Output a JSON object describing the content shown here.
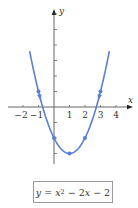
{
  "chart_data": {
    "type": "line",
    "title": "",
    "equation": "y = x^2 - 2x - 2",
    "xlabel": "x",
    "ylabel": "y",
    "xlim": [
      -2.8,
      5
    ],
    "ylim": [
      -4.5,
      6.8
    ],
    "x_ticks": [
      -2,
      -1,
      1,
      2,
      3,
      4
    ],
    "x_tick_labels": [
      "−2",
      "−1",
      "1",
      "2",
      "3",
      "4"
    ],
    "y_ticks": [
      -3,
      -2,
      -1,
      1,
      2,
      3,
      4,
      5,
      6
    ],
    "y_tick_labels": [],
    "grid": false,
    "series": [
      {
        "name": "y = x^2 - 2x - 2",
        "color": "#5b7fd6",
        "x": [
          -1,
          0,
          1,
          2,
          3
        ],
        "values": [
          1,
          -2,
          -3,
          -2,
          1
        ]
      }
    ],
    "marked_points": [
      [
        -1,
        1
      ],
      [
        0,
        -2
      ],
      [
        1,
        -3
      ],
      [
        2,
        -2
      ],
      [
        3,
        1
      ]
    ],
    "arrows": "curve has arrowheads on both branches near points (-1,1) and (3,1)"
  },
  "labels": {
    "x_axis": "x",
    "y_axis": "y",
    "equation_prefix": "y",
    "equation_eq": " = ",
    "equation_x": "x",
    "equation_exp": "2",
    "equation_rest_1": " − 2",
    "equation_x2": "x",
    "equation_rest_2": " − 2"
  },
  "colors": {
    "curve": "#5b7fd6",
    "axis": "#555555",
    "text": "#333333"
  }
}
